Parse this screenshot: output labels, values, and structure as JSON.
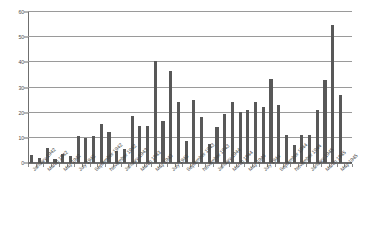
{
  "chart_data": {
    "type": "bar",
    "title": "",
    "subtitle": "",
    "xlabel": "",
    "ylabel": "",
    "ylim": [
      0,
      60
    ],
    "ytick_values": [
      0,
      10,
      20,
      30,
      40,
      50,
      60
    ],
    "ytick_labels": [
      "0",
      "10",
      "20",
      "30",
      "40",
      "50",
      "60"
    ],
    "grid": true,
    "gridlines_at": [
      10,
      20,
      30,
      40,
      50,
      60
    ],
    "legend": null,
    "legend_position": "none",
    "bar_color": "#585858",
    "axis_color": "#6f6f6f",
    "gridline_color": "#9a9a9a",
    "xtick_label_rotation": -45,
    "xtick_label_interval": 2,
    "categories": [
      "January 1942",
      "February 1942",
      "March 1942",
      "April 1942",
      "May 1942",
      "June 1942",
      "July 1942",
      "August 1942",
      "September 1942",
      "October 1942",
      "November 1942",
      "December 1942",
      "January 1943",
      "February 1943",
      "March 1943",
      "April 1943",
      "May 1943",
      "June 1943",
      "July 1943",
      "August 1943",
      "September 1943",
      "October 1943",
      "November 1943",
      "December 1943",
      "January 1944",
      "February 1944",
      "March 1944",
      "April 1944",
      "May 1944",
      "June 1944",
      "July 1944",
      "August 1944",
      "September 1944",
      "October 1944",
      "November 1944",
      "December 1944",
      "January 1945",
      "February 1945",
      "March 1945",
      "April 1945",
      "May 1945",
      "June 1945"
    ],
    "values": [
      3.0,
      1.8,
      5.8,
      1.6,
      3.4,
      2.8,
      10.8,
      9.8,
      10.6,
      15.6,
      12.4,
      4.8,
      5.6,
      18.6,
      14.6,
      14.6,
      40.6,
      16.6,
      36.4,
      24.4,
      8.6,
      25.2,
      18.4,
      7.4,
      14.4,
      19.4,
      24.2,
      20.4,
      21.2,
      24.2,
      22.2,
      33.2,
      23.2,
      11.2,
      7.0,
      11.2,
      11.2,
      21.0,
      33.0,
      55.0,
      27.0,
      0.0
    ],
    "labeled_ticks": [
      "January 1942",
      "March 1942",
      "May 1942",
      "July 1942",
      "September 1942",
      "November 1942",
      "January 1943",
      "March 1943",
      "May 1943",
      "July 1943",
      "September 1943",
      "November 1943",
      "January 1944",
      "March 1944",
      "May 1944",
      "July 1944",
      "September 1944",
      "November 1944",
      "January 1945",
      "March 1945",
      "May 1945"
    ]
  }
}
